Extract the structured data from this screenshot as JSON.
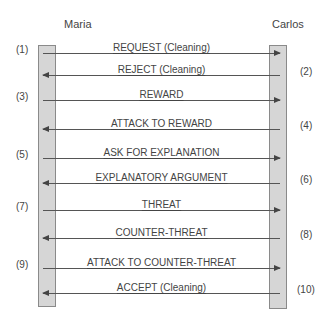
{
  "actors": {
    "left": "Maria",
    "right": "Carlos"
  },
  "messages": [
    {
      "step": "(1)",
      "label": "REQUEST (Cleaning)",
      "direction": "right",
      "y": 53
    },
    {
      "step": "(2)",
      "label": "REJECT (Cleaning)",
      "direction": "left",
      "y": 75
    },
    {
      "step": "(3)",
      "label": "REWARD",
      "direction": "right",
      "y": 100
    },
    {
      "step": "(4)",
      "label": "ATTACK TO REWARD",
      "direction": "left",
      "y": 129
    },
    {
      "step": "(5)",
      "label": "ASK FOR EXPLANATION",
      "direction": "right",
      "y": 158
    },
    {
      "step": "(6)",
      "label": "EXPLANATORY ARGUMENT",
      "direction": "left",
      "y": 183
    },
    {
      "step": "(7)",
      "label": "THREAT",
      "direction": "right",
      "y": 210
    },
    {
      "step": "(8)",
      "label": "COUNTER-THREAT",
      "direction": "left",
      "y": 238
    },
    {
      "step": "(9)",
      "label": "ATTACK TO COUNTER-THREAT",
      "direction": "right",
      "y": 268
    },
    {
      "step": "(10)",
      "label": "ACCEPT (Cleaning)",
      "direction": "left",
      "y": 293
    }
  ],
  "colors": {
    "lifeline_fill": "#d6d6d6",
    "lifeline_border": "#8a8a8a",
    "arrow": "#555555",
    "text": "#444444"
  }
}
